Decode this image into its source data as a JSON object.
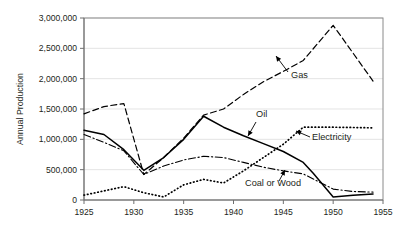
{
  "chart_data": {
    "type": "line",
    "title": "",
    "xlabel": "",
    "ylabel": "Annual Production",
    "xlim": [
      1925,
      1955
    ],
    "ylim": [
      0,
      3000000
    ],
    "grid": true,
    "legend_position": "inline-annotations",
    "x_ticks": [
      1925,
      1930,
      1935,
      1940,
      1945,
      1950,
      1955
    ],
    "x_tick_labels": [
      "1925",
      "1930",
      "1935",
      "1940",
      "1945",
      "1950",
      "1955"
    ],
    "y_ticks": [
      0,
      500000,
      1000000,
      1500000,
      2000000,
      2500000,
      3000000
    ],
    "y_tick_labels": [
      "0",
      "500,000",
      "1,000,000",
      "1,500,000",
      "2,000,000",
      "2,500,000",
      "3,000,000"
    ],
    "series": [
      {
        "name": "Gas",
        "style": "dashed",
        "x": [
          1925,
          1927,
          1929,
          1931,
          1933,
          1935,
          1937,
          1939,
          1941,
          1943,
          1945,
          1947,
          1950,
          1954
        ],
        "values": [
          1420000,
          1540000,
          1590000,
          420000,
          700000,
          1020000,
          1400000,
          1500000,
          1740000,
          1950000,
          2120000,
          2300000,
          2880000,
          1960000
        ]
      },
      {
        "name": "Oil",
        "style": "solid",
        "x": [
          1925,
          1927,
          1929,
          1931,
          1933,
          1935,
          1937,
          1939,
          1941,
          1943,
          1945,
          1947,
          1948,
          1950,
          1952,
          1954
        ],
        "values": [
          1150000,
          1080000,
          830000,
          490000,
          700000,
          1000000,
          1380000,
          1200000,
          1060000,
          930000,
          800000,
          620000,
          440000,
          50000,
          80000,
          100000
        ]
      },
      {
        "name": "Electricity",
        "style": "dotted",
        "x": [
          1925,
          1927,
          1929,
          1931,
          1933,
          1935,
          1937,
          1939,
          1941,
          1943,
          1945,
          1947,
          1950,
          1954
        ],
        "values": [
          80000,
          150000,
          220000,
          120000,
          50000,
          250000,
          340000,
          280000,
          480000,
          700000,
          920000,
          1200000,
          1200000,
          1190000
        ]
      },
      {
        "name": "Coal or Wood",
        "style": "dashdot",
        "x": [
          1925,
          1927,
          1929,
          1931,
          1933,
          1935,
          1937,
          1939,
          1941,
          1943,
          1945,
          1947,
          1950,
          1952,
          1954
        ],
        "values": [
          1080000,
          950000,
          810000,
          420000,
          560000,
          660000,
          720000,
          700000,
          620000,
          540000,
          480000,
          430000,
          180000,
          140000,
          130000
        ]
      }
    ],
    "annotations": [
      {
        "label": "Gas",
        "label_x": 291,
        "label_y": 78,
        "arrow_from_x": 288,
        "arrow_from_y": 72,
        "arrow_to_x": 276,
        "arrow_to_y": 56
      },
      {
        "label": "Oil",
        "label_x": 256,
        "label_y": 117,
        "arrow_from_x": 256,
        "arrow_from_y": 122,
        "arrow_to_x": 248,
        "arrow_to_y": 136
      },
      {
        "label": "Electricity",
        "label_x": 312,
        "label_y": 140,
        "arrow_from_x": 310,
        "arrow_from_y": 137,
        "arrow_to_x": 296,
        "arrow_to_y": 131
      },
      {
        "label": "Coal or Wood",
        "label_x": 245,
        "label_y": 186,
        "arrow_from_x": 279,
        "arrow_from_y": 181,
        "arrow_to_x": 285,
        "arrow_to_y": 170
      }
    ]
  }
}
